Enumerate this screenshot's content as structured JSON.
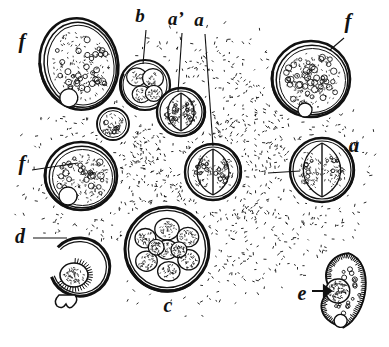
{
  "figure": {
    "style": "black-and-white stipple line engraving",
    "background_color": "#ffffff",
    "ink_color": "#111111"
  },
  "labels": [
    {
      "id": "f-top-left",
      "text": "f",
      "x": 22,
      "y": 48,
      "size": 21
    },
    {
      "id": "b",
      "text": "b",
      "x": 140,
      "y": 22,
      "size": 19
    },
    {
      "id": "a-prime",
      "text": "a’",
      "x": 176,
      "y": 25,
      "size": 19
    },
    {
      "id": "a-top",
      "text": "a",
      "x": 199,
      "y": 26,
      "size": 19
    },
    {
      "id": "f-top-right",
      "text": "f",
      "x": 348,
      "y": 28,
      "size": 21
    },
    {
      "id": "f-mid-left",
      "text": "f",
      "x": 22,
      "y": 170,
      "size": 21
    },
    {
      "id": "a-right",
      "text": "a",
      "x": 354,
      "y": 152,
      "size": 21
    },
    {
      "id": "d",
      "text": "d",
      "x": 20,
      "y": 243,
      "size": 20
    },
    {
      "id": "c",
      "text": "c",
      "x": 168,
      "y": 312,
      "size": 20
    },
    {
      "id": "e",
      "text": "e",
      "x": 302,
      "y": 300,
      "size": 20
    }
  ],
  "leader_lines": [
    {
      "id": "leader-b",
      "from": [
        146,
        30
      ],
      "to": [
        143,
        64
      ]
    },
    {
      "id": "leader-a-prime",
      "from": [
        182,
        33
      ],
      "to": [
        178,
        92
      ]
    },
    {
      "id": "leader-a-top",
      "from": [
        205,
        34
      ],
      "to": [
        213,
        146
      ]
    },
    {
      "id": "leader-f-tr",
      "from": [
        344,
        38
      ],
      "to": [
        330,
        50
      ]
    },
    {
      "id": "leader-f-ml",
      "from": [
        32,
        170
      ],
      "to": [
        78,
        163
      ]
    },
    {
      "id": "leader-d",
      "from": [
        33,
        238
      ],
      "to": [
        67,
        238
      ]
    },
    {
      "id": "leader-a-right",
      "from": [
        300,
        171
      ],
      "to": [
        268,
        173
      ]
    }
  ],
  "structures": [
    {
      "id": "f-cell-top-left",
      "label": "f",
      "kind": "mature-cyst-granular",
      "shape": "ovoid",
      "cx": 79,
      "cy": 64,
      "rx": 39,
      "ry": 46,
      "rotation": -12,
      "wall": "thick double wall",
      "contents": "many small granules, one large vacuole",
      "granule_count": 34,
      "vacuole": {
        "cx": 62,
        "cy": 95,
        "r": 9
      }
    },
    {
      "id": "f-cell-mid-left",
      "label": "f",
      "kind": "mature-cyst-granular",
      "shape": "circular",
      "cx": 81,
      "cy": 176,
      "rx": 36,
      "ry": 34,
      "rotation": 0,
      "wall": "thick double wall",
      "contents": "many ring granules, one large vacuole",
      "granule_count": 30,
      "vacuole": {
        "cx": 68,
        "cy": 196,
        "r": 9
      }
    },
    {
      "id": "f-cell-top-right",
      "label": "f",
      "kind": "mature-cyst-granular",
      "shape": "circular",
      "cx": 311,
      "cy": 79,
      "rx": 39,
      "ry": 38,
      "rotation": 0,
      "wall": "very thick dark wall",
      "contents": "densely packed ring granules, one vacuole at base",
      "granule_count": 42,
      "vacuole": {
        "cx": 305,
        "cy": 110,
        "r": 7
      }
    },
    {
      "id": "b-cell",
      "label": "b",
      "kind": "four-cell-stage",
      "shape": "circular",
      "cx": 145,
      "cy": 85,
      "rx": 25,
      "ry": 26,
      "rotation": 0,
      "wall": "double wall",
      "contents": "four blastomeres"
    },
    {
      "id": "a-prime-cell",
      "label": "a’",
      "kind": "two-cell-stage",
      "shape": "circular",
      "cx": 181,
      "cy": 112,
      "rx": 24,
      "ry": 23,
      "rotation": 0,
      "wall": "double wall",
      "contents": "two blastomeres, vertical cleavage"
    },
    {
      "id": "a-cell-centre",
      "label": "a",
      "kind": "two-cell-stage",
      "shape": "circular",
      "cx": 213,
      "cy": 172,
      "rx": 28,
      "ry": 27,
      "rotation": 0,
      "wall": "double wall",
      "contents": "two blastomeres, vertical cleavage"
    },
    {
      "id": "a-cell-right",
      "label": "a",
      "kind": "two-cell-stage",
      "shape": "circular",
      "cx": 322,
      "cy": 170,
      "rx": 32,
      "ry": 31,
      "rotation": 0,
      "wall": "thick dark wall",
      "contents": "two granular blastomeres"
    },
    {
      "id": "small-unlabelled-cell",
      "label": "",
      "kind": "small-cyst",
      "shape": "circular",
      "cx": 113,
      "cy": 124,
      "rx": 16,
      "ry": 15,
      "rotation": 0,
      "wall": "double wall",
      "contents": "coarse granular mass"
    },
    {
      "id": "c-morula",
      "label": "c",
      "kind": "morula-multicell-stage",
      "shape": "circular",
      "cx": 167,
      "cy": 249,
      "rx": 42,
      "ry": 43,
      "rotation": 0,
      "wall": "thick dark wall",
      "contents": "about nine stippled blastomeres",
      "cell_count": 9
    },
    {
      "id": "d-empty-capsule",
      "label": "d",
      "kind": "ruptured-capsule-with-escaping-embryo",
      "shape": "open-ring",
      "cx": 80,
      "cy": 267,
      "rx": 30,
      "ry": 29,
      "rotation": 0,
      "wall": "thick open ring, gap at upper left",
      "contents": "small ciliated embryo emerging at lower left"
    },
    {
      "id": "e-ciliate",
      "label": "e",
      "kind": "free-swimming-ciliated-organism",
      "shape": "reniform",
      "cx": 344,
      "cy": 290,
      "rx": 28,
      "ry": 37,
      "rotation": 10,
      "wall": "ciliated margin",
      "contents": "granular cytoplasm, large stippled nucleus, basal vacuole",
      "nucleus": {
        "cx": 338,
        "cy": 292,
        "r": 12
      },
      "pointer": "arrow from label e to nucleus"
    }
  ],
  "background_stipple": {
    "description": "dense irregular stipple field filling the central area, fading toward the margins",
    "bounds": {
      "x": 18,
      "y": 18,
      "width": 355,
      "height": 300
    },
    "dot_count": 4200
  }
}
